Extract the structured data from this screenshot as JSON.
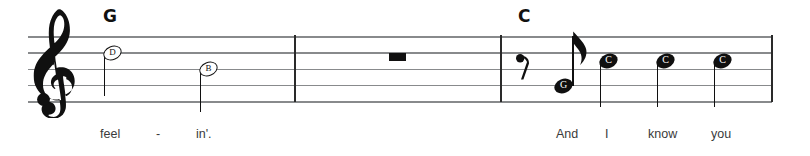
{
  "score": {
    "staff": {
      "clef": "treble-clef",
      "line_color": "#888a8c",
      "ink_color": "#101010",
      "left_x": 28,
      "right_x": 772,
      "top_line_y": 36,
      "line_spacing": 16.25
    },
    "barlines": [
      294,
      500,
      772
    ],
    "chords": [
      {
        "name": "G",
        "x": 103,
        "y": 8
      },
      {
        "name": "C",
        "x": 518,
        "y": 8
      }
    ],
    "measures": [
      {
        "index": 1,
        "elements": [
          {
            "type": "note",
            "label": "D",
            "duration": "half",
            "head": "hollow",
            "x": 112,
            "y": 52.5,
            "stem": "down"
          },
          {
            "type": "note",
            "label": "B",
            "duration": "half",
            "head": "hollow",
            "x": 208,
            "y": 69,
            "stem": "down"
          }
        ],
        "lyrics": [
          {
            "text": "feel",
            "x": 100
          },
          {
            "text": "-",
            "x": 156
          },
          {
            "text": "in'.",
            "x": 196
          }
        ]
      },
      {
        "index": 2,
        "elements": [
          {
            "type": "rest",
            "label": "whole-rest",
            "duration": "whole",
            "x": 389,
            "y": 52.5
          }
        ],
        "lyrics": []
      },
      {
        "index": 3,
        "elements": [
          {
            "type": "rest",
            "label": "eighth-rest",
            "duration": "eighth",
            "x": 517,
            "y": 55
          },
          {
            "type": "note",
            "label": "G",
            "duration": "eighth",
            "head": "filled",
            "x": 564,
            "y": 85.5,
            "stem": "up",
            "flag": true
          },
          {
            "type": "note",
            "label": "C",
            "duration": "quarter",
            "head": "filled",
            "x": 608,
            "y": 61,
            "stem": "down"
          },
          {
            "type": "note",
            "label": "C",
            "duration": "quarter",
            "head": "filled",
            "x": 665,
            "y": 61,
            "stem": "down"
          },
          {
            "type": "note",
            "label": "C",
            "duration": "quarter",
            "head": "filled",
            "x": 722,
            "y": 61,
            "stem": "down"
          }
        ],
        "lyrics": [
          {
            "text": "And",
            "x": 556
          },
          {
            "text": "I",
            "x": 605
          },
          {
            "text": "know",
            "x": 648
          },
          {
            "text": "you",
            "x": 711
          }
        ]
      }
    ],
    "lyrics_baseline_y": 128
  }
}
